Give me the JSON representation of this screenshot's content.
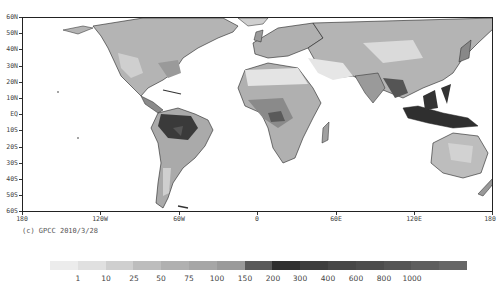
{
  "map": {
    "title": "",
    "credit": "(c) GPCC 2010/3/28",
    "lat_labels": [
      "60N",
      "50N",
      "40N",
      "30N",
      "20N",
      "10N",
      "EQ",
      "10S",
      "20S",
      "30S",
      "40S",
      "50S",
      "60S"
    ],
    "lon_labels": [
      "180",
      "120W",
      "60W",
      "0",
      "60E",
      "120E",
      "180"
    ],
    "projection": "equirectangular",
    "extent": {
      "lon": [
        -180,
        180
      ],
      "lat": [
        -60,
        60
      ]
    }
  },
  "legend": {
    "labels": [
      "1",
      "10",
      "25",
      "50",
      "75",
      "100",
      "150",
      "200",
      "300",
      "400",
      "600",
      "800",
      "1000"
    ],
    "colors": [
      "#ececec",
      "#e0e0e0",
      "#cfcfcf",
      "#bdbdbd",
      "#b0b0b0",
      "#a6a6a6",
      "#9a9a9a",
      "#5a5a5a",
      "#2f2f2f",
      "#3e3e3e",
      "#474747",
      "#4d4d4d",
      "#555555",
      "#5e5e5e",
      "#666666"
    ]
  },
  "colors": {
    "frame": "#222222",
    "ocean": "#ffffff",
    "land_dry": "#d8d8d8",
    "land_mid": "#aaaaaa",
    "land_wet": "#3a3a3a"
  }
}
